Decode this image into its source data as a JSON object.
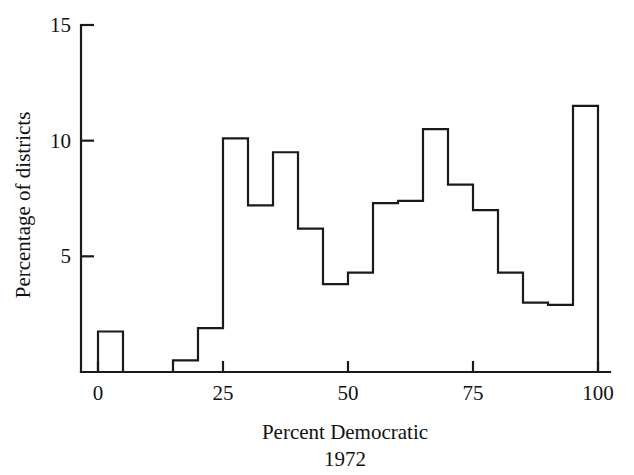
{
  "figure": {
    "name": "histogram-percent-democratic-1972",
    "background_color": "#ffffff",
    "line_color": "#1a1a1a"
  },
  "chart_data": {
    "type": "bar",
    "title": "",
    "subtitle": "",
    "xlabel": "Percent Democratic",
    "xlabel_line2": "1972",
    "ylabel": "Percentage of districts",
    "xlim": [
      0,
      100
    ],
    "ylim": [
      0,
      15
    ],
    "grid": false,
    "legend": false,
    "bin_width": 5,
    "x_ticks": [
      0,
      25,
      50,
      75,
      100
    ],
    "x_tick_labels": [
      "0",
      "25",
      "50",
      "75",
      "100"
    ],
    "y_ticks": [
      5,
      10,
      15
    ],
    "y_tick_labels": [
      "5",
      "10",
      "15"
    ],
    "categories": [
      "0-5",
      "5-10",
      "10-15",
      "15-20",
      "20-25",
      "25-30",
      "30-35",
      "35-40",
      "40-45",
      "45-50",
      "50-55",
      "55-60",
      "60-65",
      "65-70",
      "70-75",
      "75-80",
      "80-85",
      "85-90",
      "90-95",
      "95-100"
    ],
    "bin_edges": [
      0,
      5,
      10,
      15,
      20,
      25,
      30,
      35,
      40,
      45,
      50,
      55,
      60,
      65,
      70,
      75,
      80,
      85,
      90,
      95,
      100
    ],
    "values": [
      1.75,
      0.0,
      0.0,
      0.5,
      1.9,
      10.1,
      7.2,
      9.5,
      6.2,
      3.8,
      4.3,
      7.3,
      7.4,
      10.5,
      8.1,
      7.0,
      4.3,
      3.0,
      2.9,
      11.5
    ]
  },
  "axes": {
    "y_label_text": "Percentage of districts",
    "x_label_text": "Percent Democratic",
    "x_label_sub_text": "1972"
  }
}
